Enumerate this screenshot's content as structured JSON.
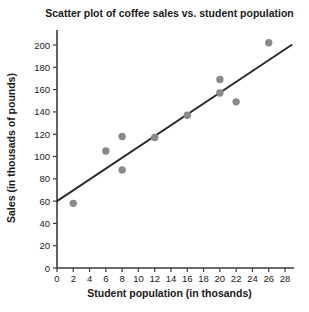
{
  "chart_data": {
    "type": "scatter",
    "title": "Scatter plot of coffee sales vs. student population",
    "xlabel": "Student population (in thosands)",
    "ylabel": "Sales (in thousads of pounds)",
    "xlim": [
      0,
      28
    ],
    "ylim": [
      0,
      200
    ],
    "xtick_step": 2,
    "ytick_step": 20,
    "xticks": [
      0,
      2,
      4,
      6,
      8,
      10,
      12,
      14,
      16,
      18,
      20,
      22,
      24,
      26,
      28
    ],
    "yticks": [
      0,
      20,
      40,
      60,
      80,
      100,
      120,
      140,
      160,
      180,
      200
    ],
    "grid": false,
    "legend": null,
    "points": [
      {
        "x": 2,
        "y": 58
      },
      {
        "x": 6,
        "y": 105
      },
      {
        "x": 8,
        "y": 88
      },
      {
        "x": 8,
        "y": 118
      },
      {
        "x": 12,
        "y": 117
      },
      {
        "x": 16,
        "y": 137
      },
      {
        "x": 20,
        "y": 157
      },
      {
        "x": 20,
        "y": 169
      },
      {
        "x": 22,
        "y": 149
      },
      {
        "x": 26,
        "y": 202
      }
    ],
    "trendline": {
      "x1": 0,
      "y1": 60,
      "x2": 28.8,
      "y2": 200
    },
    "colors": {
      "point": "#8a8a8a",
      "trendline": "#2e2e2e",
      "axis": "#3a3a3a",
      "text": "#1a1a1a",
      "background": "#ffffff"
    }
  }
}
